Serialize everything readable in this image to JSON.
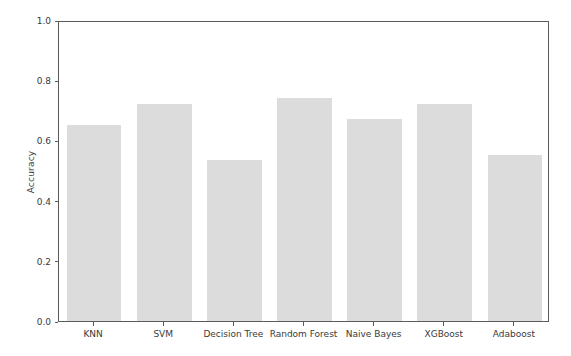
{
  "chart_data": {
    "type": "bar",
    "title": "",
    "subtitle": "",
    "xlabel": "",
    "ylabel": "Accuracy",
    "categories": [
      "KNN",
      "SVM",
      "Decision Tree",
      "Random Forest",
      "Naive Bayes",
      "XGBoost",
      "Adaboost"
    ],
    "values": [
      0.65,
      0.72,
      0.535,
      0.74,
      0.67,
      0.72,
      0.55
    ],
    "series": [
      {
        "name": "Accuracy",
        "values": [
          0.65,
          0.72,
          0.535,
          0.74,
          0.67,
          0.72,
          0.55
        ]
      }
    ],
    "ylim": [
      0.0,
      1.0
    ],
    "xlim": [
      -0.5,
      6.5
    ],
    "yticks": [
      0.0,
      0.2,
      0.4,
      0.6,
      0.8,
      1.0
    ],
    "ytick_labels": [
      "0.0",
      "0.2",
      "0.4",
      "0.6",
      "0.8",
      "1.0"
    ],
    "grid": false,
    "legend": false,
    "legend_position": "none",
    "bar_color": "#dcdcdc",
    "axis_color": "#5a5a5a",
    "background_color": "#ffffff",
    "bar_width_fraction": 0.78
  }
}
